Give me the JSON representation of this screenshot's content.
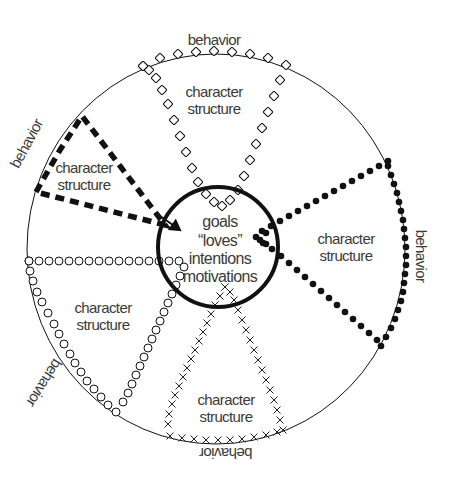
{
  "diagram": {
    "core": {
      "lines": [
        "goals",
        "“loves”",
        "intentions",
        "motivations"
      ]
    },
    "segments": [
      {
        "id": "top",
        "marker": "diamond",
        "inner_label": [
          "character",
          "structure"
        ],
        "outer_label": "behavior"
      },
      {
        "id": "upper-left",
        "marker": "dash",
        "inner_label": [
          "character",
          "structure"
        ],
        "outer_label": "behavior"
      },
      {
        "id": "right",
        "marker": "filled-dot",
        "inner_label": [
          "character",
          "structure"
        ],
        "outer_label": "behavior"
      },
      {
        "id": "lower-left",
        "marker": "open-circle",
        "inner_label": [
          "character",
          "structure"
        ],
        "outer_label": "behavior"
      },
      {
        "id": "bottom",
        "marker": "cross",
        "inner_label": [
          "character",
          "structure"
        ],
        "outer_label": "behavior"
      }
    ],
    "colors": {
      "line": "#111111",
      "text": "#3a3a3a",
      "background": "#ffffff"
    }
  }
}
